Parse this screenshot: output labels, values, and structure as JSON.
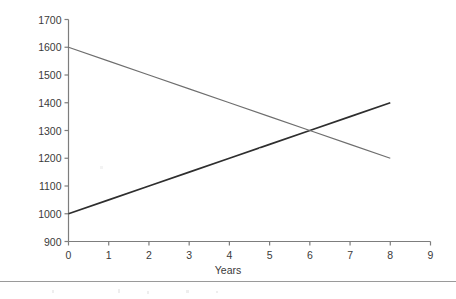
{
  "chart_data": {
    "type": "line",
    "title": "",
    "xlabel": "Years",
    "ylabel": "Population",
    "xlim": [
      0,
      9
    ],
    "ylim": [
      900,
      1700
    ],
    "grid": false,
    "legend": "none",
    "x_ticks": [
      "0",
      "1",
      "2",
      "3",
      "4",
      "5",
      "6",
      "7",
      "8",
      "9"
    ],
    "y_ticks": [
      "900",
      "1000",
      "1100",
      "1200",
      "1300",
      "1400",
      "1500",
      "1600",
      "1700"
    ],
    "x_tick_values": [
      0,
      1,
      2,
      3,
      4,
      5,
      6,
      7,
      8,
      9
    ],
    "y_tick_values": [
      900,
      1000,
      1100,
      1200,
      1300,
      1400,
      1500,
      1600,
      1700
    ],
    "intersection": {
      "x": 6,
      "y": 1300
    },
    "series": [
      {
        "name": "increasing-population",
        "color": "#2e2e2e",
        "width": 1.6,
        "x": [
          0,
          8
        ],
        "values": [
          1000,
          1400
        ],
        "points": [
          {
            "x": 0,
            "y": 1000
          },
          {
            "x": 1,
            "y": 1050
          },
          {
            "x": 2,
            "y": 1100
          },
          {
            "x": 3,
            "y": 1150
          },
          {
            "x": 4,
            "y": 1200
          },
          {
            "x": 5,
            "y": 1250
          },
          {
            "x": 6,
            "y": 1300
          },
          {
            "x": 7,
            "y": 1350
          },
          {
            "x": 8,
            "y": 1400
          }
        ]
      },
      {
        "name": "decreasing-population",
        "color": "#6e6e6e",
        "width": 1.1,
        "x": [
          0,
          8
        ],
        "values": [
          1600,
          1200
        ],
        "points": [
          {
            "x": 0,
            "y": 1600
          },
          {
            "x": 1,
            "y": 1550
          },
          {
            "x": 2,
            "y": 1500
          },
          {
            "x": 3,
            "y": 1450
          },
          {
            "x": 4,
            "y": 1400
          },
          {
            "x": 5,
            "y": 1350
          },
          {
            "x": 6,
            "y": 1300
          },
          {
            "x": 7,
            "y": 1250
          },
          {
            "x": 8,
            "y": 1200
          }
        ]
      }
    ],
    "axis_color": "#7d7d7d",
    "text_color": "#3a3a3a"
  },
  "footer": {
    "rule_color": "#9a9a9a"
  }
}
